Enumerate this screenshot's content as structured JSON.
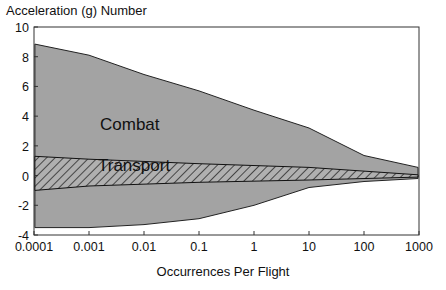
{
  "chart_data": {
    "type": "area",
    "title": "",
    "ylabel": "Acceleration (g) Number",
    "xlabel": "Occurrences Per Flight",
    "xscale": "log",
    "xlim": [
      0.0001,
      1000
    ],
    "ylim": [
      -4,
      10
    ],
    "x_ticks": [
      "0.0001",
      "0.001",
      "0.01",
      "0.1",
      "1",
      "10",
      "100",
      "1000"
    ],
    "y_ticks": [
      "10",
      "8",
      "6",
      "4",
      "2",
      "0",
      "-2",
      "-4"
    ],
    "grid": false,
    "legend": "none (labels inside regions)",
    "series": [
      {
        "name": "Combat",
        "style": "gray-filled envelope",
        "color": "#a3a3a3",
        "x": [
          0.0001,
          0.001,
          0.01,
          0.1,
          1,
          10,
          100,
          1000
        ],
        "upper": [
          8.85,
          8.1,
          6.8,
          5.7,
          4.4,
          3.2,
          1.35,
          0.55
        ],
        "lower": [
          -3.5,
          -3.5,
          -3.3,
          -2.9,
          -2.0,
          -0.8,
          -0.4,
          -0.2
        ]
      },
      {
        "name": "Transport",
        "style": "hatched envelope",
        "color": "#6e6e6e",
        "x": [
          0.0001,
          0.001,
          0.1,
          10,
          1000
        ],
        "upper": [
          1.3,
          1.1,
          0.8,
          0.55,
          0.05
        ],
        "lower": [
          -1.0,
          -0.7,
          -0.45,
          -0.3,
          -0.1
        ]
      }
    ],
    "annotations": [
      {
        "text": "Combat",
        "x": 0.01,
        "y": 3.1
      },
      {
        "text": "Transport",
        "x": 0.01,
        "y": 0.3
      }
    ]
  },
  "labels": {
    "ylabel": "Acceleration (g) Number",
    "xlabel": "Occurrences Per Flight",
    "combat": "Combat",
    "transport": "Transport"
  }
}
